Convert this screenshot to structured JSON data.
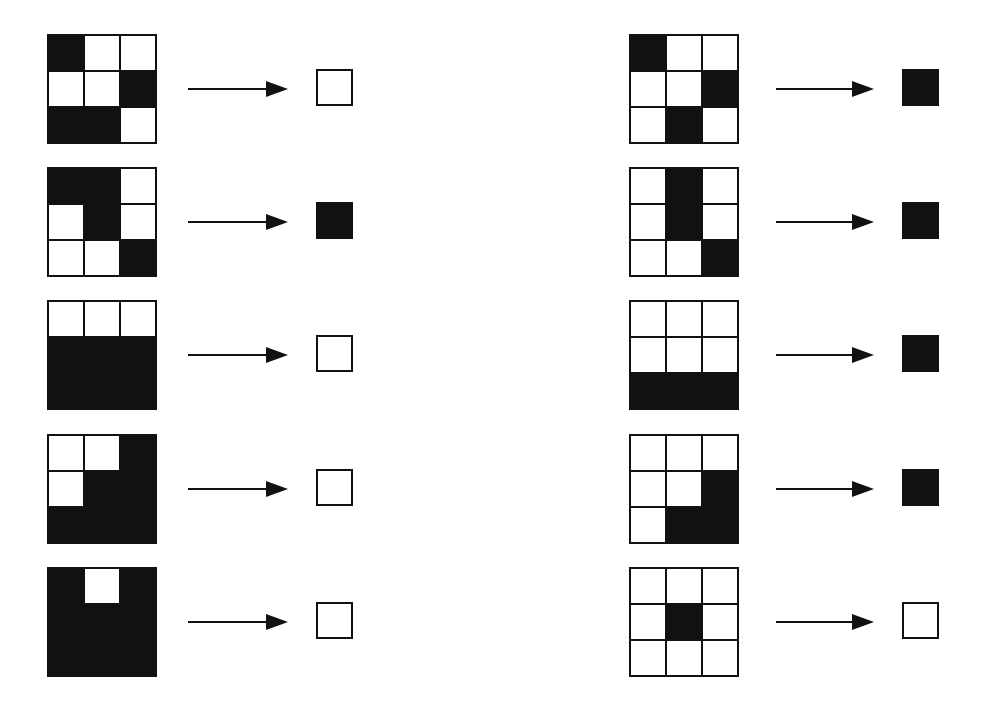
{
  "colors": {
    "black": "#111111",
    "white": "#ffffff"
  },
  "examples": {
    "left": [
      {
        "grid": [
          [
            1,
            0,
            0
          ],
          [
            0,
            0,
            1
          ],
          [
            1,
            1,
            0
          ]
        ],
        "output": 0
      },
      {
        "grid": [
          [
            1,
            1,
            0
          ],
          [
            0,
            1,
            0
          ],
          [
            0,
            0,
            1
          ]
        ],
        "output": 1
      },
      {
        "grid": [
          [
            0,
            0,
            0
          ],
          [
            1,
            1,
            1
          ],
          [
            1,
            1,
            1
          ]
        ],
        "output": 0
      },
      {
        "grid": [
          [
            0,
            0,
            1
          ],
          [
            0,
            1,
            1
          ],
          [
            1,
            1,
            1
          ]
        ],
        "output": 0
      },
      {
        "grid": [
          [
            1,
            0,
            1
          ],
          [
            1,
            1,
            1
          ],
          [
            1,
            1,
            1
          ]
        ],
        "output": 0
      }
    ],
    "right": [
      {
        "grid": [
          [
            1,
            0,
            0
          ],
          [
            0,
            0,
            1
          ],
          [
            0,
            1,
            0
          ]
        ],
        "output": 1
      },
      {
        "grid": [
          [
            0,
            1,
            0
          ],
          [
            0,
            1,
            0
          ],
          [
            0,
            0,
            1
          ]
        ],
        "output": 1
      },
      {
        "grid": [
          [
            0,
            0,
            0
          ],
          [
            0,
            0,
            0
          ],
          [
            1,
            1,
            1
          ]
        ],
        "output": 1
      },
      {
        "grid": [
          [
            0,
            0,
            0
          ],
          [
            0,
            0,
            1
          ],
          [
            0,
            1,
            1
          ]
        ],
        "output": 1
      },
      {
        "grid": [
          [
            0,
            0,
            0
          ],
          [
            0,
            1,
            0
          ],
          [
            0,
            0,
            0
          ]
        ],
        "output": 0
      }
    ]
  },
  "layout": {
    "row_tops": [
      34,
      167,
      300,
      434,
      567
    ],
    "left": {
      "grid_x": 47,
      "arrow_x": 188,
      "arrow_w": 100,
      "out_x": 316
    },
    "right": {
      "grid_x": 629,
      "arrow_x": 776,
      "arrow_w": 98,
      "out_x": 902
    }
  }
}
